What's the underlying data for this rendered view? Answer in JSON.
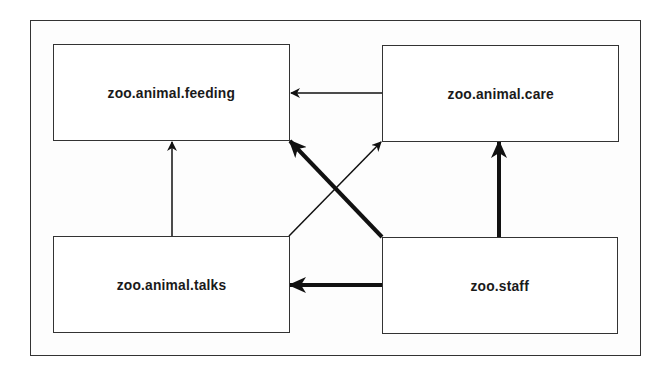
{
  "diagram": {
    "nodes": [
      {
        "id": "feeding",
        "label": "zoo.animal.feeding"
      },
      {
        "id": "care",
        "label": "zoo.animal.care"
      },
      {
        "id": "talks",
        "label": "zoo.animal.talks"
      },
      {
        "id": "staff",
        "label": "zoo.staff"
      }
    ],
    "edges": [
      {
        "from": "care",
        "to": "feeding",
        "weight": "thin"
      },
      {
        "from": "talks",
        "to": "feeding",
        "weight": "thin"
      },
      {
        "from": "talks",
        "to": "care",
        "weight": "thin"
      },
      {
        "from": "staff",
        "to": "feeding",
        "weight": "thick"
      },
      {
        "from": "staff",
        "to": "care",
        "weight": "thick"
      },
      {
        "from": "staff",
        "to": "talks",
        "weight": "thick"
      }
    ]
  }
}
